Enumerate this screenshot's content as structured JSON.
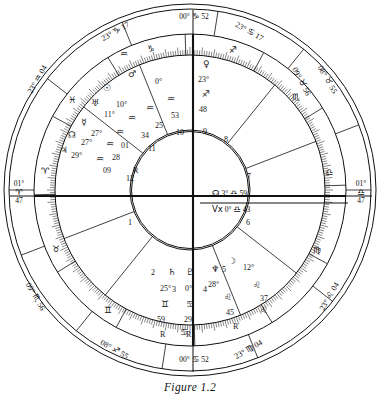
{
  "figure": {
    "caption": "Figure 1.2"
  },
  "axes": {
    "asc": {
      "name": "Ascendant",
      "deg": "01°",
      "sign": "♈",
      "min": "47"
    },
    "dsc": {
      "name": "Descendant",
      "deg": "01°",
      "sign": "♎",
      "min": "47"
    },
    "mc": {
      "name": "Midheaven",
      "deg": "00°",
      "sign": "♑",
      "min": "52"
    },
    "ic": {
      "name": "Imum Coeli",
      "deg": "00°",
      "sign": "♋",
      "min": "52"
    }
  },
  "cusps": [
    {
      "house": "11",
      "deg": "23°",
      "sign": "♑",
      "min": "17"
    },
    {
      "house": "12",
      "deg": "08°",
      "sign": "♐",
      "min": "55"
    },
    {
      "house": "2",
      "deg": "09°",
      "sign": "♏",
      "min": "56"
    },
    {
      "house": "3",
      "deg": "23°",
      "sign": "♍",
      "min": "04"
    },
    {
      "house": "5",
      "deg": "23°",
      "sign": "♌",
      "min": "04"
    },
    {
      "house": "6",
      "deg": "09°",
      "sign": "♉",
      "min": "56"
    },
    {
      "house": "8",
      "deg": "08°",
      "sign": "♉",
      "min": "55"
    },
    {
      "house": "9",
      "deg": "23°",
      "sign": "♋",
      "min": "17"
    },
    {
      "house": "10",
      "deg": "00°",
      "sign": "♋",
      "min": "52"
    },
    {
      "house": "1",
      "deg": "23°",
      "sign": "♒",
      "min": "04"
    }
  ],
  "angle_readouts": {
    "node_line": {
      "glyph": "☊",
      "deg": "3°",
      "sign": "♎",
      "min": "59"
    },
    "vertex_line": {
      "glyph": "Vx",
      "deg": "0°",
      "sign": "♎",
      "min": "43"
    }
  },
  "houses": [
    "1",
    "2",
    "3",
    "4",
    "5",
    "6",
    "7",
    "8",
    "9",
    "10",
    "11",
    "12"
  ],
  "planets": [
    {
      "name": "mars",
      "glyph": "♂",
      "deg": "0°",
      "sign": "♒",
      "min": "53",
      "retro": ""
    },
    {
      "name": "sun",
      "glyph": "☉",
      "deg": "10°",
      "sign": "♒",
      "min": "25",
      "retro": ""
    },
    {
      "name": "uranus",
      "glyph": "♅",
      "deg": "11°",
      "sign": "♒",
      "min": "34",
      "retro": ""
    },
    {
      "name": "mercury",
      "glyph": "☿",
      "deg": "27°",
      "sign": "♒",
      "min": "01",
      "retro": "R"
    },
    {
      "name": "north-node",
      "glyph": "☊",
      "deg": "27°",
      "sign": "♒",
      "min": "28",
      "retro": ""
    },
    {
      "name": "jupiter",
      "glyph": "♃",
      "deg": "29°",
      "sign": "♒",
      "min": "09",
      "retro": ""
    },
    {
      "name": "venus",
      "glyph": "♀",
      "deg": "23°",
      "sign": "♐",
      "min": "48",
      "retro": ""
    },
    {
      "name": "moon",
      "glyph": "☽",
      "deg": "12°",
      "sign": "♌",
      "min": "37",
      "retro": ""
    },
    {
      "name": "neptune",
      "glyph": "♆",
      "deg": "28°",
      "sign": "♌",
      "min": "45",
      "retro": "R"
    },
    {
      "name": "saturn",
      "glyph": "♄",
      "deg": "25°",
      "sign": "♊",
      "min": "59",
      "retro": "R"
    },
    {
      "name": "pluto",
      "glyph": "♇",
      "deg": "0°",
      "sign": "♋",
      "min": "29",
      "retro": "R"
    }
  ],
  "signs_on_rim": [
    {
      "name": "capricorn",
      "glyph": "♑"
    },
    {
      "name": "sagittarius",
      "glyph": "♐"
    },
    {
      "name": "scorpio",
      "glyph": "♏"
    },
    {
      "name": "libra",
      "glyph": "♎"
    },
    {
      "name": "virgo",
      "glyph": "♍"
    },
    {
      "name": "leo",
      "glyph": "♌"
    },
    {
      "name": "cancer",
      "glyph": "♋"
    },
    {
      "name": "gemini",
      "glyph": "♊"
    },
    {
      "name": "taurus",
      "glyph": "♉"
    },
    {
      "name": "aries",
      "glyph": "♈"
    },
    {
      "name": "pisces",
      "glyph": "♓"
    },
    {
      "name": "aquarius",
      "glyph": "♒"
    }
  ],
  "colors": {
    "ink": "#111111",
    "paper": "#ffffff"
  }
}
